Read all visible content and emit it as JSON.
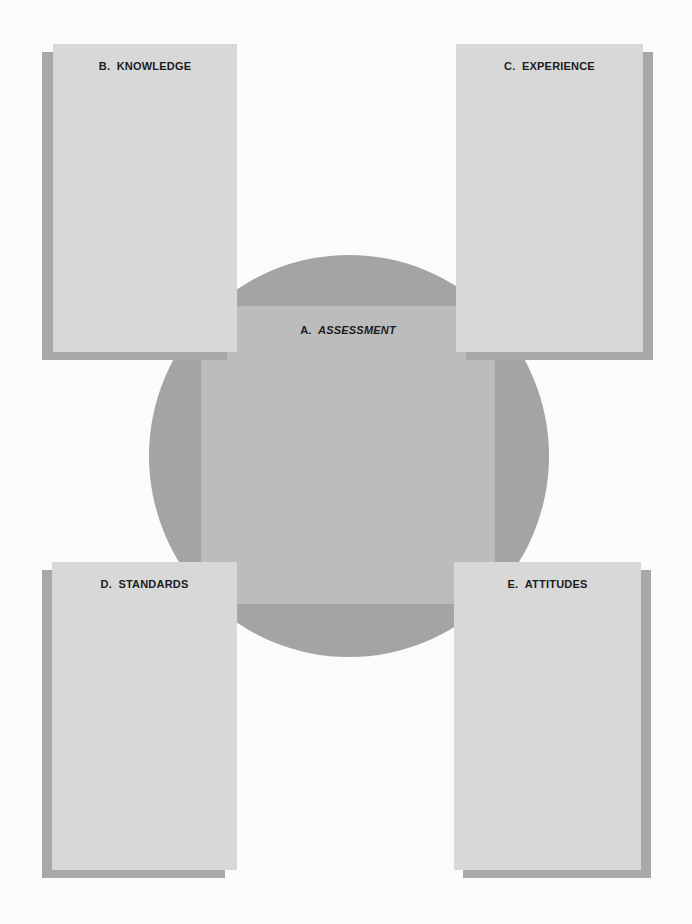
{
  "diagram": {
    "center": {
      "letter": "A.",
      "title": "ASSESSMENT"
    },
    "boxes": [
      {
        "letter": "B.",
        "title": "KNOWLEDGE",
        "position": "top-left"
      },
      {
        "letter": "C.",
        "title": "EXPERIENCE",
        "position": "top-right"
      },
      {
        "letter": "D.",
        "title": "STANDARDS",
        "position": "bottom-left"
      },
      {
        "letter": "E.",
        "title": "ATTITUDES",
        "position": "bottom-right"
      }
    ]
  },
  "colors": {
    "card": "#d8d8d8",
    "shadow": "#a8a8a8",
    "circle": "#a4a4a4",
    "center_square": "#bcbcbc",
    "text": "#1c1c1c"
  }
}
